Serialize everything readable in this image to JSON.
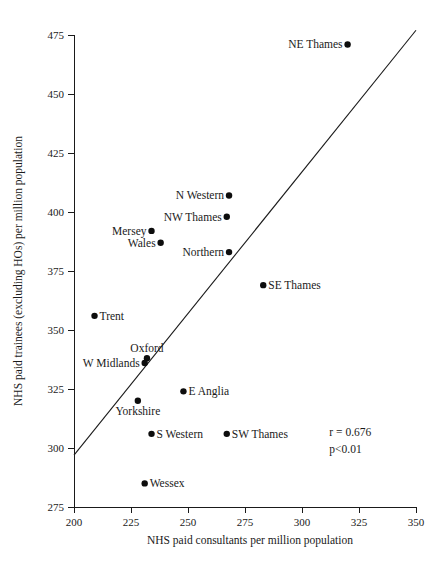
{
  "chart_data": {
    "type": "scatter",
    "title": "",
    "xlabel": "NHS paid consultants per million population",
    "ylabel": "NHS paid trainees (excluding HOs) per million population",
    "xlim": [
      200,
      350
    ],
    "ylim": [
      275,
      475
    ],
    "xticks": [
      200,
      225,
      250,
      275,
      300,
      325,
      350
    ],
    "yticks": [
      275,
      300,
      325,
      350,
      375,
      400,
      425,
      450,
      475
    ],
    "grid": false,
    "legend": "none",
    "points": [
      {
        "label": "NE Thames",
        "x": 320,
        "y": 471,
        "label_side": "left"
      },
      {
        "label": "N Western",
        "x": 268,
        "y": 407,
        "label_side": "left"
      },
      {
        "label": "NW Thames",
        "x": 267,
        "y": 398,
        "label_side": "left"
      },
      {
        "label": "Mersey",
        "x": 234,
        "y": 392,
        "label_side": "left"
      },
      {
        "label": "Wales",
        "x": 238,
        "y": 387,
        "label_side": "left"
      },
      {
        "label": "Northern",
        "x": 268,
        "y": 383,
        "label_side": "left"
      },
      {
        "label": "SE Thames",
        "x": 283,
        "y": 369,
        "label_side": "right"
      },
      {
        "label": "Trent",
        "x": 209,
        "y": 356,
        "label_side": "right"
      },
      {
        "label": "Oxford",
        "x": 232,
        "y": 338,
        "label_side": "above"
      },
      {
        "label": "W Midlands",
        "x": 231,
        "y": 336,
        "label_side": "left"
      },
      {
        "label": "E Anglia",
        "x": 248,
        "y": 324,
        "label_side": "right"
      },
      {
        "label": "Yorkshire",
        "x": 228,
        "y": 320,
        "label_side": "below"
      },
      {
        "label": "S Western",
        "x": 234,
        "y": 306,
        "label_side": "right"
      },
      {
        "label": "SW Thames",
        "x": 267,
        "y": 306,
        "label_side": "right"
      },
      {
        "label": "Wessex",
        "x": 231,
        "y": 285,
        "label_side": "right"
      }
    ],
    "fit_line": {
      "x0": 200,
      "y0": 297,
      "x1": 350,
      "y1": 477
    },
    "annotations": [
      {
        "name": "correlation",
        "text": "r = 0.676",
        "x": 312,
        "y": 305
      },
      {
        "name": "p-value",
        "text": "p<0.01",
        "x": 312,
        "y": 298
      }
    ],
    "colors": {
      "point": "#0d0d0d",
      "axis": "#1a1a1a",
      "line": "#1a1a1a",
      "background": "#ffffff"
    }
  }
}
